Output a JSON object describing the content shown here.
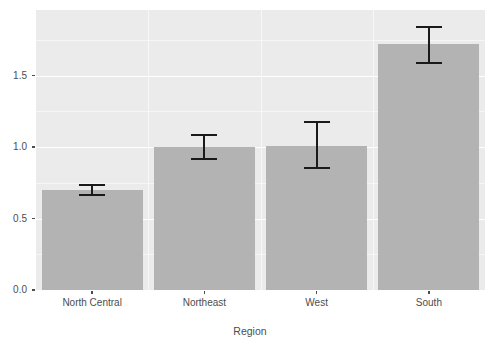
{
  "chart_data": {
    "type": "bar",
    "title": "",
    "subtitle": "",
    "xlabel": "Region",
    "ylabel": "",
    "categories": [
      "North Central",
      "Northeast",
      "West",
      "South"
    ],
    "values": [
      0.7,
      1.0,
      1.01,
      1.72
    ],
    "errors": [
      {
        "category": "North Central",
        "lower": 0.66,
        "upper": 0.74
      },
      {
        "category": "Northeast",
        "lower": 0.91,
        "upper": 1.09
      },
      {
        "category": "West",
        "lower": 0.85,
        "upper": 1.18
      },
      {
        "category": "South",
        "lower": 1.58,
        "upper": 1.85
      }
    ],
    "ylim": [
      0.0,
      1.96
    ],
    "ytick_labels": [
      "0.0",
      "0.5",
      "1.0",
      "1.5"
    ],
    "ytick_values": [
      0.0,
      0.5,
      1.0,
      1.5
    ],
    "yminor_values": [
      0.25,
      0.75,
      1.25,
      1.75
    ],
    "grid": true,
    "legend": "none",
    "bar_color": "#b3b3b3",
    "errorbar_color": "#1a1a1a",
    "panel_background": "#ebebeb",
    "gridline_color": "#ffffff",
    "axis_text_color": "#4d4d4d"
  },
  "axis": {
    "x_title": "Region"
  }
}
